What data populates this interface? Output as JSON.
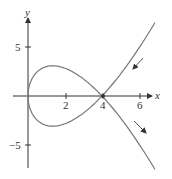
{
  "chart_data": {
    "type": "line",
    "title": "",
    "xlabel": "x",
    "ylabel": "y",
    "x_ticks": [
      "2",
      "4",
      "6"
    ],
    "y_ticks": [
      "5",
      "-5"
    ],
    "xlim": [
      -1,
      7
    ],
    "ylim": [
      -8,
      8
    ],
    "grid": false,
    "series": [
      {
        "name": "parametric curve",
        "parametric": {
          "x": "t^2",
          "y": "t^3 - 4t"
        },
        "points": [
          {
            "x": 7.0,
            "y": -5.96
          },
          {
            "x": 6.0,
            "y": -4.9
          },
          {
            "x": 4.0,
            "y": 0
          },
          {
            "x": 1.33,
            "y": -3.08
          },
          {
            "x": 0,
            "y": 0
          },
          {
            "x": 1.33,
            "y": 3.08
          },
          {
            "x": 4.0,
            "y": 0
          },
          {
            "x": 6.0,
            "y": 4.9
          },
          {
            "x": 7.0,
            "y": 5.96
          }
        ]
      }
    ],
    "annotations": [
      {
        "type": "arrow",
        "direction": "down-left",
        "near": "upper branch"
      },
      {
        "type": "arrow",
        "direction": "down-right",
        "near": "lower branch"
      },
      {
        "type": "point",
        "x": 4,
        "y": 0,
        "label": "4"
      }
    ]
  },
  "labels": {
    "x_axis": "x",
    "y_axis": "y",
    "x_tick_2": "2",
    "x_tick_4": "4",
    "x_tick_6": "6",
    "y_tick_5": "5",
    "y_tick_neg5": "−5"
  }
}
